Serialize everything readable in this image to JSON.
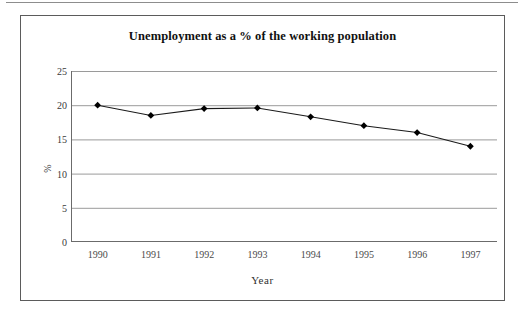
{
  "chart_data": {
    "type": "line",
    "title": "Unemployment as a % of the working population",
    "xlabel": "Year",
    "ylabel": "%",
    "categories": [
      "1990",
      "1991",
      "1992",
      "1993",
      "1994",
      "1995",
      "1996",
      "1997"
    ],
    "series": [
      {
        "name": "Unemployment",
        "values": [
          20.0,
          18.5,
          19.5,
          19.6,
          18.3,
          17.0,
          16.0,
          14.0
        ]
      }
    ],
    "ylim": [
      0,
      25
    ],
    "y_ticks": [
      "0",
      "5",
      "10",
      "15",
      "20",
      "25"
    ],
    "y_tick_values": [
      0,
      5,
      10,
      15,
      20,
      25
    ],
    "grid": "horizontal",
    "legend": "none",
    "marker": "diamond",
    "colors": {
      "line": "#1a1a1a",
      "marker": "#000000",
      "gridline": "#9a9a9a",
      "axis": "#6b6b6b",
      "frame": "#5b5b5b",
      "plot_background": "#ffffff",
      "title_text": "#111111",
      "tick_text": "#3a3a3a"
    }
  }
}
